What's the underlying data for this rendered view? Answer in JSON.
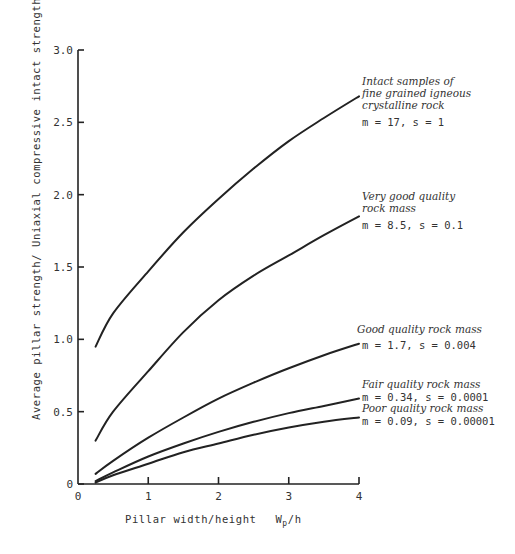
{
  "chart_data": {
    "type": "line",
    "title": "",
    "xlabel": "Pillar width/height  Wp/h",
    "ylabel": "Average pillar strength/ Uniaxial compressive intact strength  σ1s.av./σc",
    "xlim": [
      0,
      4
    ],
    "ylim": [
      0,
      3.0
    ],
    "grid": false,
    "legend": "inline annotations at right end of each curve",
    "x_ticks": [
      "0",
      "1",
      "2",
      "3",
      "4"
    ],
    "y_ticks": [
      "0",
      "0.5",
      "1.0",
      "1.5",
      "2.0",
      "2.5",
      "3.0"
    ],
    "x": [
      0.25,
      0.5,
      1.0,
      1.5,
      2.0,
      2.5,
      3.0,
      3.5,
      4.0
    ],
    "series": [
      {
        "name": "Intact samples of fine grained igneous crystalline rock",
        "params": "m = 17, s = 1",
        "values": [
          0.95,
          1.18,
          1.47,
          1.74,
          1.97,
          2.18,
          2.37,
          2.53,
          2.68
        ]
      },
      {
        "name": "Very good quality rock mass",
        "params": "m = 8.5, s = 0.1",
        "values": [
          0.3,
          0.5,
          0.78,
          1.05,
          1.27,
          1.44,
          1.58,
          1.72,
          1.85
        ]
      },
      {
        "name": "Good quality rock mass",
        "params": "m = 1.7, s = 0.004",
        "values": [
          0.07,
          0.16,
          0.32,
          0.46,
          0.59,
          0.7,
          0.8,
          0.89,
          0.97
        ]
      },
      {
        "name": "Fair quality rock mass",
        "params": "m = 0.34, s = 0.0001",
        "values": [
          0.02,
          0.08,
          0.19,
          0.28,
          0.36,
          0.43,
          0.49,
          0.54,
          0.59
        ]
      },
      {
        "name": "Poor quality rock mass",
        "params": "m = 0.09, s = 0.00001",
        "values": [
          0.01,
          0.06,
          0.14,
          0.22,
          0.28,
          0.34,
          0.39,
          0.43,
          0.46
        ]
      }
    ]
  },
  "annotations": [
    {
      "lines": [
        "Intact samples of",
        "fine grained igneous",
        "crystalline rock"
      ],
      "params": "m = 17, s = 1"
    },
    {
      "lines": [
        "Very good quality",
        "rock mass"
      ],
      "params": "m = 8.5, s = 0.1"
    },
    {
      "lines": [
        "Good quality rock mass"
      ],
      "params": "m = 1.7, s = 0.004"
    },
    {
      "lines": [
        "Fair quality rock mass"
      ],
      "params": "m = 0.34, s = 0.0001"
    },
    {
      "lines": [
        "Poor quality rock mass"
      ],
      "params": "m = 0.09, s = 0.00001"
    }
  ],
  "axes": {
    "x_title": "Pillar width/height",
    "x_symbol": "W",
    "x_symbol_sub": "p",
    "x_symbol_tail": "/h",
    "y_title": "Average pillar strength/ Uniaxial compressive intact strength",
    "y_symbol": "σ1s.av./σc"
  }
}
